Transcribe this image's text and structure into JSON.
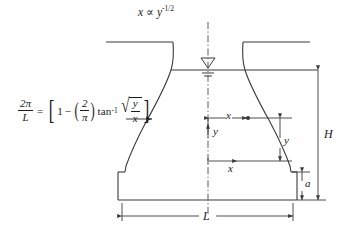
{
  "figure": {
    "title_equation": {
      "var_x": "x",
      "proportional": "∝",
      "var_y": "y",
      "exponent": "-1/2",
      "plain": "x ∝ y^-1/2"
    },
    "profile_equation": {
      "lhs_numerator": "2π",
      "lhs_denominator": "L",
      "equals": "=",
      "bracket_open": "[",
      "one": "1",
      "minus": "−",
      "paren_open": "(",
      "inner_numerator": "2",
      "inner_denominator": "π",
      "paren_close": ")",
      "arctan": "tan",
      "arctan_exponent": "-1",
      "radical": "√",
      "rad_numerator": "y",
      "rad_denominator": "x",
      "bracket_close": "]",
      "plain": "2π/L = [1 - (2/π) tan^-1 √(y/x)]"
    },
    "dimensions": {
      "height_total": "H",
      "slab_thickness": "a",
      "base_width": "L",
      "coord_x_upper": "x",
      "coord_x_lower": "x",
      "coord_y_axis": "y",
      "coord_y_depth": "y"
    },
    "symbols": {
      "water_surface": "water-surface-triangle",
      "centerline": "centerline-dash-dot",
      "leader_arrow": "formula-leader-arrow"
    },
    "colors": {
      "ink": "#1a1a1a",
      "outline": "#3a3a3a",
      "background": "#ffffff"
    }
  }
}
